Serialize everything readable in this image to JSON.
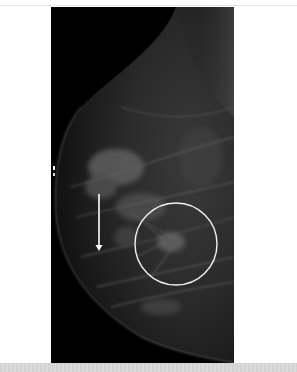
{
  "figure": {
    "background_color": "#ffffff",
    "image_background": "#000000",
    "annotations": {
      "arrow": {
        "color": "#ffffff",
        "x": 48,
        "y_start": 187,
        "y_end": 243,
        "direction": "down"
      },
      "circle": {
        "color": "#ffffff",
        "cx": 125,
        "cy": 237,
        "r": 41
      }
    }
  },
  "bottom_bar": {
    "color": "#d6d6d6"
  }
}
